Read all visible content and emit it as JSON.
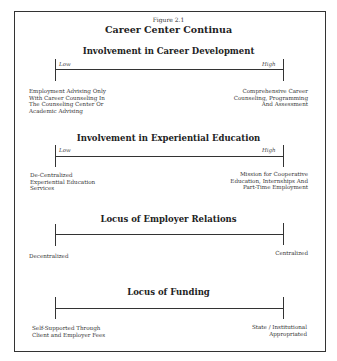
{
  "figure": {
    "label": "Figure 2.1",
    "title": "Career Center Continua"
  },
  "continua": [
    {
      "title": "Involvement in Career Development",
      "low_label": "Low",
      "high_label": "High",
      "left_desc": [
        "Employment Advising Only",
        "With Career Counseling In",
        "The Counseling Center Or",
        "Academic Advising"
      ],
      "right_desc": [
        "Comprehensive Career",
        "Counseling, Programming",
        "And Assessment"
      ]
    },
    {
      "title": "Involvement in Experiential Education",
      "low_label": "Low",
      "high_label": "High",
      "left_desc": [
        "De-Centralized",
        "Experiential Education",
        "Services"
      ],
      "right_desc": [
        "Mission for Cooperative",
        "Education, Internships And",
        "Part-Time Employment"
      ]
    },
    {
      "title": "Locus of Employer Relations",
      "left_desc": [
        "Decentralized"
      ],
      "right_desc": [
        "Centralized"
      ]
    },
    {
      "title": "Locus of Funding",
      "left_desc": [
        "Self-Supported Through",
        "Client and Employer Fees"
      ],
      "right_desc": [
        "State / Institutional",
        "Appropriated"
      ]
    }
  ]
}
